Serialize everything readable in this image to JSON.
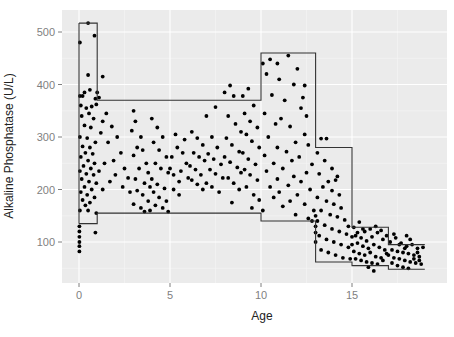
{
  "chart_data": {
    "type": "scatter",
    "title": "",
    "xlabel": "Age",
    "ylabel": "Alkaline Phosphatase (U/L)",
    "xlim": [
      -0.9,
      19.9
    ],
    "ylim": [
      20,
      535
    ],
    "x_ticks": [
      0,
      5,
      10,
      15
    ],
    "y_ticks": [
      100,
      200,
      300,
      400,
      500
    ],
    "grid": true,
    "panel_background": "#ebebeb",
    "grid_color": "#ffffff",
    "point_color": "#000000",
    "line_color": "#333333",
    "reference_intervals": {
      "upper": [
        {
          "age_from": 0,
          "age_to": 1,
          "value": 517
        },
        {
          "age_from": 1,
          "age_to": 10,
          "value": 370
        },
        {
          "age_from": 10,
          "age_to": 13,
          "value": 460
        },
        {
          "age_from": 13,
          "age_to": 15,
          "value": 280
        },
        {
          "age_from": 15,
          "age_to": 17,
          "value": 128
        },
        {
          "age_from": 17,
          "age_to": 19,
          "value": 95
        }
      ],
      "lower": [
        {
          "age_from": 0,
          "age_to": 1,
          "value": 135
        },
        {
          "age_from": 1,
          "age_to": 10,
          "value": 155
        },
        {
          "age_from": 10,
          "age_to": 13,
          "value": 140
        },
        {
          "age_from": 13,
          "age_to": 15,
          "value": 62
        },
        {
          "age_from": 15,
          "age_to": 17,
          "value": 55
        },
        {
          "age_from": 17,
          "age_to": 19,
          "value": 48
        }
      ]
    },
    "points": [
      [
        0.5,
        517
      ],
      [
        0.05,
        480
      ],
      [
        0.85,
        493
      ],
      [
        0.5,
        418
      ],
      [
        0.6,
        390
      ],
      [
        0.3,
        385
      ],
      [
        0.05,
        378
      ],
      [
        0.2,
        378
      ],
      [
        0.9,
        373
      ],
      [
        1.1,
        375
      ],
      [
        0.1,
        360
      ],
      [
        0.4,
        355
      ],
      [
        0.7,
        358
      ],
      [
        0.95,
        362
      ],
      [
        0.15,
        340
      ],
      [
        0.55,
        345
      ],
      [
        0.8,
        335
      ],
      [
        0.3,
        322
      ],
      [
        0.65,
        318
      ],
      [
        0.05,
        300
      ],
      [
        0.45,
        298
      ],
      [
        0.9,
        290
      ],
      [
        0.2,
        282
      ],
      [
        0.6,
        280
      ],
      [
        0.35,
        270
      ],
      [
        0.75,
        268
      ],
      [
        0.1,
        262
      ],
      [
        0.5,
        255
      ],
      [
        0.85,
        250
      ],
      [
        0.25,
        245
      ],
      [
        0.65,
        240
      ],
      [
        0.05,
        235
      ],
      [
        0.4,
        230
      ],
      [
        0.8,
        228
      ],
      [
        0.15,
        220
      ],
      [
        0.55,
        215
      ],
      [
        0.95,
        212
      ],
      [
        0.3,
        205
      ],
      [
        0.7,
        200
      ],
      [
        0.1,
        195
      ],
      [
        0.45,
        190
      ],
      [
        0.85,
        185
      ],
      [
        0.2,
        180
      ],
      [
        0.6,
        175
      ],
      [
        0.35,
        170
      ],
      [
        0.05,
        160
      ],
      [
        0.5,
        160
      ],
      [
        0.95,
        155
      ],
      [
        0.02,
        130
      ],
      [
        0.02,
        120
      ],
      [
        0.02,
        110
      ],
      [
        0.02,
        100
      ],
      [
        0.02,
        92
      ],
      [
        0.02,
        82
      ],
      [
        0.9,
        118
      ],
      [
        1.3,
        415
      ],
      [
        1.0,
        385
      ],
      [
        1.5,
        345
      ],
      [
        1.3,
        330
      ],
      [
        1.8,
        320
      ],
      [
        2.1,
        300
      ],
      [
        1.2,
        308
      ],
      [
        1.6,
        290
      ],
      [
        2.3,
        270
      ],
      [
        1.9,
        255
      ],
      [
        1.4,
        250
      ],
      [
        2.5,
        240
      ],
      [
        1.1,
        235
      ],
      [
        2.0,
        228
      ],
      [
        2.7,
        222
      ],
      [
        1.7,
        215
      ],
      [
        2.4,
        205
      ],
      [
        1.3,
        200
      ],
      [
        2.8,
        195
      ],
      [
        3.0,
        350
      ],
      [
        3.1,
        330
      ],
      [
        2.9,
        312
      ],
      [
        3.4,
        300
      ],
      [
        3.2,
        280
      ],
      [
        3.5,
        275
      ],
      [
        3.0,
        265
      ],
      [
        3.7,
        250
      ],
      [
        3.3,
        240
      ],
      [
        3.8,
        232
      ],
      [
        3.1,
        220
      ],
      [
        3.6,
        212
      ],
      [
        3.9,
        205
      ],
      [
        3.2,
        198
      ],
      [
        3.5,
        190
      ],
      [
        3.8,
        178
      ],
      [
        3.0,
        172
      ],
      [
        3.4,
        165
      ],
      [
        3.6,
        158
      ],
      [
        3.9,
        160
      ],
      [
        4.0,
        335
      ],
      [
        4.3,
        318
      ],
      [
        4.6,
        300
      ],
      [
        4.1,
        290
      ],
      [
        4.4,
        275
      ],
      [
        4.8,
        262
      ],
      [
        4.2,
        250
      ],
      [
        4.5,
        240
      ],
      [
        4.9,
        232
      ],
      [
        4.0,
        220
      ],
      [
        4.3,
        210
      ],
      [
        4.7,
        202
      ],
      [
        4.1,
        195
      ],
      [
        4.4,
        185
      ],
      [
        4.8,
        178
      ],
      [
        4.2,
        170
      ],
      [
        4.6,
        165
      ],
      [
        4.9,
        158
      ],
      [
        5.0,
        240
      ],
      [
        5.2,
        228
      ],
      [
        5.5,
        215
      ],
      [
        5.1,
        262
      ],
      [
        5.4,
        280
      ],
      [
        5.8,
        295
      ],
      [
        5.3,
        305
      ],
      [
        5.7,
        270
      ],
      [
        5.9,
        250
      ],
      [
        5.6,
        235
      ],
      [
        6.0,
        222
      ],
      [
        5.2,
        200
      ],
      [
        5.5,
        190
      ],
      [
        6.2,
        310
      ],
      [
        6.5,
        298
      ],
      [
        6.8,
        285
      ],
      [
        6.3,
        270
      ],
      [
        6.6,
        262
      ],
      [
        6.9,
        255
      ],
      [
        6.1,
        245
      ],
      [
        6.4,
        238
      ],
      [
        6.7,
        228
      ],
      [
        6.2,
        218
      ],
      [
        6.5,
        210
      ],
      [
        6.8,
        200
      ],
      [
        7.0,
        340
      ],
      [
        7.3,
        300
      ],
      [
        7.6,
        280
      ],
      [
        7.1,
        268
      ],
      [
        7.4,
        258
      ],
      [
        7.8,
        248
      ],
      [
        7.2,
        238
      ],
      [
        7.5,
        230
      ],
      [
        7.9,
        222
      ],
      [
        7.0,
        212
      ],
      [
        7.3,
        205
      ],
      [
        7.7,
        195
      ],
      [
        7.5,
        357
      ],
      [
        8.0,
        385
      ],
      [
        8.3,
        398
      ],
      [
        8.5,
        378
      ],
      [
        8.2,
        340
      ],
      [
        8.6,
        325
      ],
      [
        8.9,
        310
      ],
      [
        8.1,
        298
      ],
      [
        8.4,
        285
      ],
      [
        8.8,
        272
      ],
      [
        8.0,
        262
      ],
      [
        8.3,
        252
      ],
      [
        8.7,
        242
      ],
      [
        8.9,
        232
      ],
      [
        8.2,
        222
      ],
      [
        8.5,
        212
      ],
      [
        8.8,
        200
      ],
      [
        8.4,
        175
      ],
      [
        9.0,
        378
      ],
      [
        9.3,
        392
      ],
      [
        9.6,
        360
      ],
      [
        9.1,
        345
      ],
      [
        9.4,
        330
      ],
      [
        9.8,
        318
      ],
      [
        9.2,
        305
      ],
      [
        9.5,
        292
      ],
      [
        9.9,
        280
      ],
      [
        9.0,
        270
      ],
      [
        9.3,
        258
      ],
      [
        9.7,
        248
      ],
      [
        9.1,
        238
      ],
      [
        9.4,
        228
      ],
      [
        9.8,
        218
      ],
      [
        9.2,
        205
      ],
      [
        9.6,
        190
      ],
      [
        9.9,
        180
      ],
      [
        9.5,
        165
      ],
      [
        10.1,
        440
      ],
      [
        10.5,
        448
      ],
      [
        10.9,
        440
      ],
      [
        11.5,
        455
      ],
      [
        10.3,
        420
      ],
      [
        12.0,
        430
      ],
      [
        11.0,
        410
      ],
      [
        11.8,
        400
      ],
      [
        12.4,
        398
      ],
      [
        10.6,
        380
      ],
      [
        12.3,
        375
      ],
      [
        11.3,
        370
      ],
      [
        12.2,
        355
      ],
      [
        10.2,
        345
      ],
      [
        11.1,
        335
      ],
      [
        12.5,
        340
      ],
      [
        10.8,
        325
      ],
      [
        11.6,
        320
      ],
      [
        12.4,
        305
      ],
      [
        10.4,
        300
      ],
      [
        11.9,
        290
      ],
      [
        10.9,
        280
      ],
      [
        12.6,
        285
      ],
      [
        11.4,
        272
      ],
      [
        10.2,
        265
      ],
      [
        12.1,
        262
      ],
      [
        11.7,
        255
      ],
      [
        10.7,
        250
      ],
      [
        12.8,
        248
      ],
      [
        11.2,
        240
      ],
      [
        10.3,
        235
      ],
      [
        12.5,
        232
      ],
      [
        11.8,
        225
      ],
      [
        10.9,
        220
      ],
      [
        12.2,
        215
      ],
      [
        11.5,
        208
      ],
      [
        10.5,
        205
      ],
      [
        12.7,
        200
      ],
      [
        11.0,
        195
      ],
      [
        12.0,
        190
      ],
      [
        10.7,
        185
      ],
      [
        11.6,
        178
      ],
      [
        12.4,
        172
      ],
      [
        11.2,
        168
      ],
      [
        10.1,
        160
      ],
      [
        12.9,
        160
      ],
      [
        11.9,
        152
      ],
      [
        12.6,
        145
      ],
      [
        12.8,
        140
      ],
      [
        13.3,
        297
      ],
      [
        13.6,
        297
      ],
      [
        13.1,
        270
      ],
      [
        13.5,
        255
      ],
      [
        13.9,
        240
      ],
      [
        14.2,
        225
      ],
      [
        13.2,
        230
      ],
      [
        13.7,
        215
      ],
      [
        14.1,
        218
      ],
      [
        13.4,
        205
      ],
      [
        13.9,
        198
      ],
      [
        14.3,
        190
      ],
      [
        13.1,
        185
      ],
      [
        13.6,
        178
      ],
      [
        14.0,
        172
      ],
      [
        14.4,
        165
      ],
      [
        13.3,
        160
      ],
      [
        13.8,
        152
      ],
      [
        14.2,
        148
      ],
      [
        14.6,
        142
      ],
      [
        13.1,
        140
      ],
      [
        13.5,
        132
      ],
      [
        13.9,
        125
      ],
      [
        14.3,
        120
      ],
      [
        14.7,
        115
      ],
      [
        13.2,
        112
      ],
      [
        13.6,
        105
      ],
      [
        14.0,
        100
      ],
      [
        14.4,
        95
      ],
      [
        14.8,
        90
      ],
      [
        13.3,
        85
      ],
      [
        13.7,
        80
      ],
      [
        14.1,
        75
      ],
      [
        14.5,
        70
      ],
      [
        14.9,
        68
      ],
      [
        13.0,
        150
      ],
      [
        13.0,
        130
      ],
      [
        13.0,
        118
      ],
      [
        13.0,
        100
      ],
      [
        14.8,
        130
      ],
      [
        15.1,
        128
      ],
      [
        15.4,
        138
      ],
      [
        15.7,
        120
      ],
      [
        16.0,
        125
      ],
      [
        15.2,
        112
      ],
      [
        15.5,
        108
      ],
      [
        15.8,
        102
      ],
      [
        16.1,
        110
      ],
      [
        16.4,
        118
      ],
      [
        16.7,
        105
      ],
      [
        15.3,
        98
      ],
      [
        15.6,
        92
      ],
      [
        15.9,
        88
      ],
      [
        16.2,
        95
      ],
      [
        16.5,
        90
      ],
      [
        16.8,
        85
      ],
      [
        15.1,
        82
      ],
      [
        15.4,
        78
      ],
      [
        15.7,
        75
      ],
      [
        16.0,
        80
      ],
      [
        16.3,
        72
      ],
      [
        16.6,
        70
      ],
      [
        16.9,
        78
      ],
      [
        15.2,
        68
      ],
      [
        15.5,
        65
      ],
      [
        15.8,
        62
      ],
      [
        16.1,
        60
      ],
      [
        16.4,
        58
      ],
      [
        16.7,
        65
      ],
      [
        15.9,
        52
      ],
      [
        16.2,
        45
      ],
      [
        15.3,
        118
      ],
      [
        15.6,
        125
      ],
      [
        16.3,
        130
      ],
      [
        16.6,
        122
      ],
      [
        16.9,
        112
      ],
      [
        15.0,
        95
      ],
      [
        15.0,
        110
      ],
      [
        17.1,
        100
      ],
      [
        17.4,
        108
      ],
      [
        17.7,
        98
      ],
      [
        18.0,
        92
      ],
      [
        18.3,
        95
      ],
      [
        18.6,
        88
      ],
      [
        18.9,
        90
      ],
      [
        17.2,
        85
      ],
      [
        17.5,
        82
      ],
      [
        17.8,
        80
      ],
      [
        18.1,
        78
      ],
      [
        18.4,
        75
      ],
      [
        18.7,
        72
      ],
      [
        17.0,
        75
      ],
      [
        17.3,
        70
      ],
      [
        17.6,
        68
      ],
      [
        17.9,
        65
      ],
      [
        18.2,
        62
      ],
      [
        18.5,
        60
      ],
      [
        18.8,
        58
      ],
      [
        17.2,
        60
      ],
      [
        17.5,
        55
      ],
      [
        17.8,
        52
      ],
      [
        18.1,
        50
      ],
      [
        18.4,
        68
      ],
      [
        18.7,
        65
      ],
      [
        17.6,
        95
      ],
      [
        18.0,
        112
      ],
      [
        17.3,
        115
      ],
      [
        18.2,
        105
      ],
      [
        17.9,
        88
      ],
      [
        18.6,
        80
      ]
    ]
  }
}
